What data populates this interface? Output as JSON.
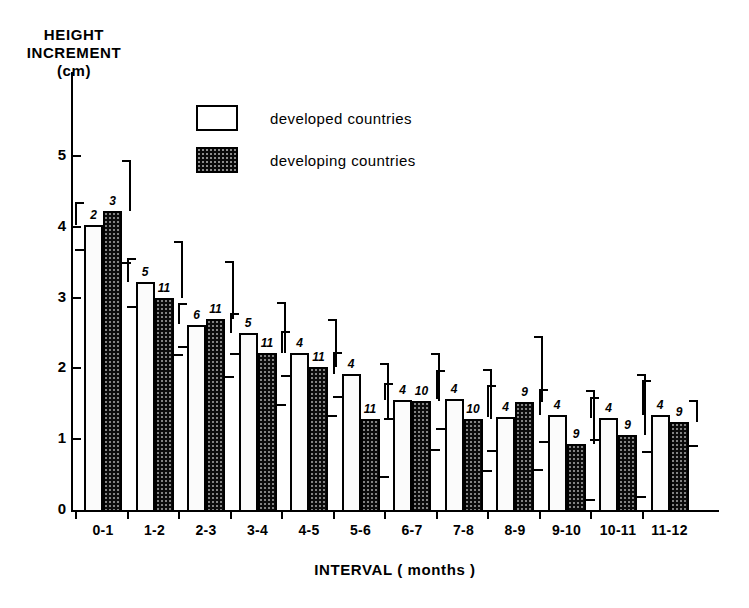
{
  "axes": {
    "y_title_lines": [
      "HEIGHT",
      "INCREMENT",
      "(cm)"
    ],
    "y_tick_labels": [
      "0",
      "1",
      "2",
      "3",
      "4",
      "5"
    ],
    "x_title": "INTERVAL  ( months )"
  },
  "legend": {
    "items": [
      {
        "label": "developed   countries",
        "swatch": "open-square-icon"
      },
      {
        "label": "developing  countries",
        "swatch": "filled-square-icon"
      }
    ]
  },
  "chart_data": {
    "type": "bar",
    "title": "",
    "xlabel": "INTERVAL  ( months )",
    "ylabel": "HEIGHT INCREMENT (cm)",
    "ylim": [
      0,
      5.6
    ],
    "yticks": [
      0,
      1,
      2,
      3,
      4,
      5
    ],
    "grid": false,
    "legend_position": "top-center",
    "error_bars": "upper-only (bracket whiskers above bars)",
    "categories": [
      "0-1",
      "1-2",
      "2-3",
      "3-4",
      "4-5",
      "5-6",
      "6-7",
      "7-8",
      "8-9",
      "9-10",
      "10-11",
      "11-12"
    ],
    "series": [
      {
        "name": "developed   countries",
        "color": "#ffffff",
        "values": [
          4.02,
          3.22,
          2.62,
          2.5,
          2.22,
          1.92,
          1.55,
          1.57,
          1.31,
          1.34,
          1.3,
          1.34
        ],
        "n": [
          2,
          5,
          6,
          5,
          4,
          4,
          4,
          4,
          4,
          4,
          4,
          4
        ],
        "error_upper": [
          4.35,
          3.56,
          2.92,
          2.78,
          2.53,
          2.23,
          1.8,
          1.98,
          1.77,
          1.71,
          1.6,
          1.84
        ]
      },
      {
        "name": "developing  countries",
        "color": "#0b0b0b",
        "values": [
          4.22,
          3.0,
          2.7,
          2.22,
          2.02,
          1.28,
          1.54,
          1.28,
          1.52,
          0.93,
          1.06,
          1.24
        ],
        "n": [
          3,
          11,
          11,
          11,
          11,
          11,
          10,
          10,
          9,
          9,
          9,
          9
        ],
        "error_upper": [
          4.94,
          3.8,
          3.51,
          2.94,
          2.7,
          2.08,
          2.22,
          1.99,
          2.46,
          1.7,
          1.92,
          1.56
        ]
      }
    ]
  }
}
